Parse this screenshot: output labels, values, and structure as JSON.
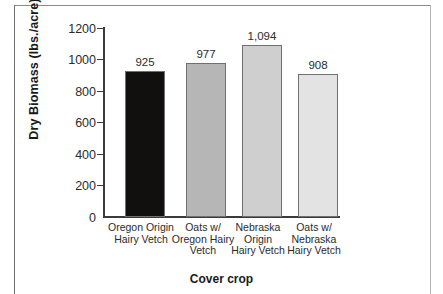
{
  "chart_data": {
    "type": "bar",
    "title": "",
    "xlabel": "Cover crop",
    "ylabel": "Dry Biomass (lbs./acre)",
    "categories": [
      "Oregon Origin Hairy Vetch",
      "Oats w/ Oregon Hairy Vetch",
      "Nebraska Origin Hairy Vetch",
      "Oats w/ Nebraska Hairy Vetch"
    ],
    "category_lines": [
      [
        "Oregon Origin",
        "Hairy Vetch"
      ],
      [
        "Oats w/",
        "Oregon Hairy",
        "Vetch"
      ],
      [
        "Nebraska",
        "Origin",
        "Hairy Vetch"
      ],
      [
        "Oats w/",
        "Nebraska",
        "Hairy Vetch"
      ]
    ],
    "values": [
      925,
      977,
      1094,
      908
    ],
    "value_labels": [
      "925",
      "977",
      "1,094",
      "908"
    ],
    "bar_colors": [
      "#120f0f",
      "#b6b6b6",
      "#cfcfcf",
      "#e3e3e3"
    ],
    "bar_border_color": "#707070",
    "ylim": [
      0,
      1200
    ],
    "yticks": [
      1200,
      1000,
      800,
      600,
      400,
      200,
      0
    ],
    "ytick_labels": [
      "1200",
      "1000",
      "800",
      "600",
      "400",
      "200",
      "0"
    ],
    "grid": false,
    "legend": false,
    "legend_position": "none"
  },
  "frame": {
    "line_color_top": "#8c8c8c",
    "line_color_left": "#6e6e6e",
    "line_color_right": "#b4b4b4"
  }
}
